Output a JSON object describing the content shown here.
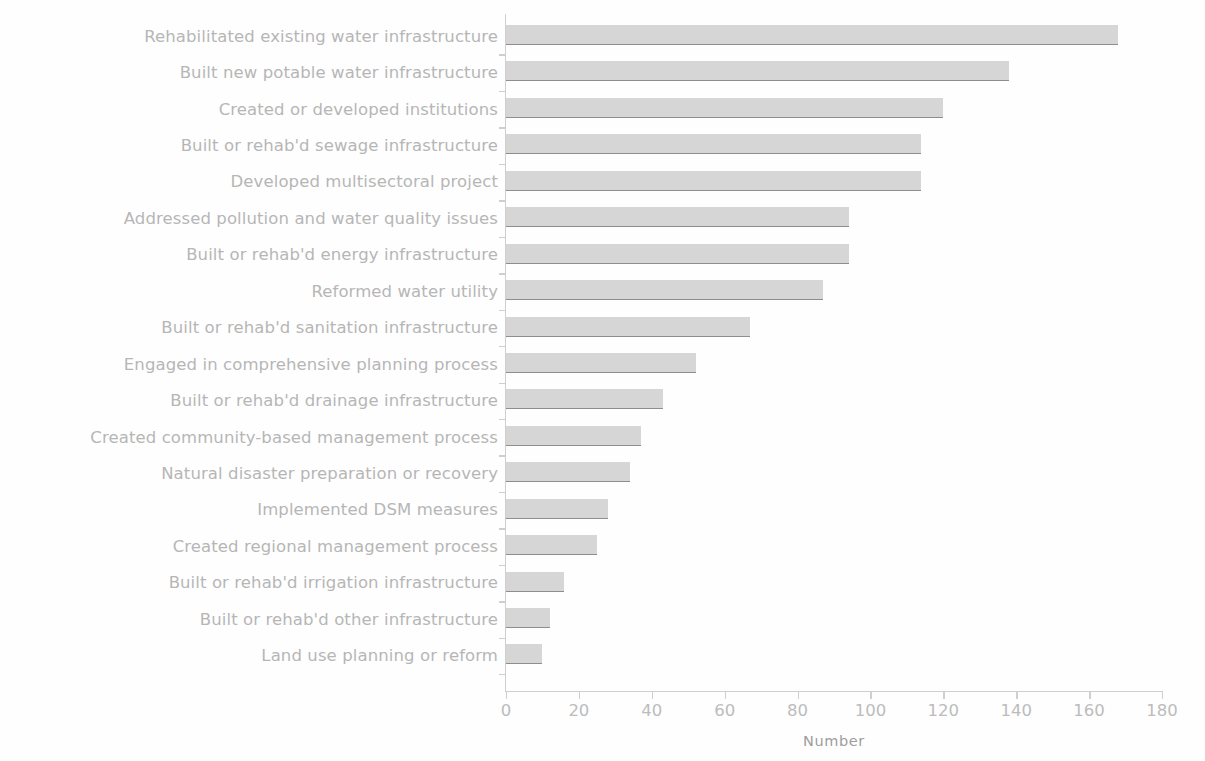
{
  "chart_data": {
    "type": "bar",
    "orientation": "horizontal",
    "title": "",
    "xlabel": "Number",
    "ylabel": "",
    "xlim": [
      0,
      180
    ],
    "xticks": [
      0,
      20,
      40,
      60,
      80,
      100,
      120,
      140,
      160,
      180
    ],
    "grid": false,
    "legend": null,
    "bar_color": "#d6d6d6",
    "bar_edge_color": "#8e8e8e",
    "label_color": "#b6b6b6",
    "axis_color": "#cfcfcf",
    "categories": [
      "Rehabilitated existing water infrastructure",
      "Built new potable water infrastructure",
      "Created or developed institutions",
      "Built or rehab'd sewage infrastructure",
      "Developed multisectoral project",
      "Addressed pollution and water quality issues",
      "Built or rehab'd energy infrastructure",
      "Reformed water utility",
      "Built or rehab'd sanitation infrastructure",
      "Engaged in comprehensive planning process",
      "Built or rehab'd drainage infrastructure",
      "Created community-based management process",
      "Natural disaster preparation or recovery",
      "Implemented DSM measures",
      "Created regional management process",
      "Built or rehab'd irrigation infrastructure",
      "Built or rehab'd other infrastructure",
      "Land use planning or reform"
    ],
    "values": [
      168,
      138,
      120,
      114,
      114,
      94,
      94,
      87,
      67,
      52,
      43,
      37,
      34,
      28,
      25,
      16,
      12,
      10
    ]
  }
}
